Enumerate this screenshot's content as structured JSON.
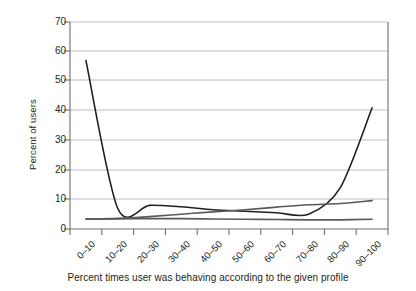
{
  "chart_data": {
    "type": "line",
    "title": "",
    "xlabel": "Percent times user was behaving according to the given profile",
    "ylabel": "Percent of users",
    "categories": [
      "0–10",
      "10–20",
      "20–30",
      "30–40",
      "40–50",
      "50–60",
      "60–70",
      "70–80",
      "80–90",
      "90–100"
    ],
    "yticks": [
      0,
      10,
      20,
      30,
      40,
      50,
      60,
      70
    ],
    "ylim": [
      0,
      70
    ],
    "grid": true,
    "legend": "none",
    "series": [
      {
        "name": "u-shaped-curve",
        "values": [
          57,
          7,
          8,
          7.5,
          6.5,
          6,
          5.5,
          5,
          14,
          41
        ]
      },
      {
        "name": "rising-curve",
        "values": [
          3.4,
          3.6,
          4.2,
          5.0,
          5.8,
          6.5,
          7.4,
          8.2,
          8.6,
          9.6
        ]
      },
      {
        "name": "flat-low-curve",
        "values": [
          3.4,
          3.4,
          3.5,
          3.5,
          3.4,
          3.3,
          3.2,
          3.1,
          3.1,
          3.3
        ]
      }
    ],
    "colors": {
      "line": "#231f20",
      "grid": "#bcbec0",
      "axis": "#58595b",
      "background": "#ffffff"
    }
  },
  "axis_labels": {
    "y0": "0",
    "y10": "10",
    "y20": "20",
    "y30": "30",
    "y40": "40",
    "y50": "50",
    "y60": "60",
    "y70": "70"
  }
}
